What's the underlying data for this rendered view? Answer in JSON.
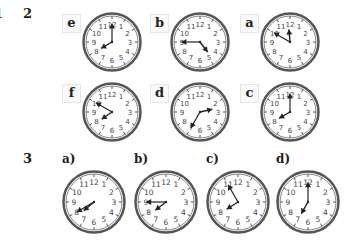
{
  "page": {
    "cut_off_number": "1",
    "section2": {
      "number": "2",
      "clocks": [
        {
          "label": "e",
          "hour": 8,
          "minute": 0
        },
        {
          "label": "b",
          "hour": 4,
          "minute": 45
        },
        {
          "label": "a",
          "hour": 11,
          "minute": 50
        },
        {
          "label": "f",
          "hour": 7,
          "minute": 50
        },
        {
          "label": "d",
          "hour": 2,
          "minute": 35
        },
        {
          "label": "c",
          "hour": 8,
          "minute": 0
        }
      ]
    },
    "section3": {
      "number": "3",
      "clocks": [
        {
          "label": "a)",
          "hour": 7,
          "minute": 40
        },
        {
          "label": "b)",
          "hour": 7,
          "minute": 45
        },
        {
          "label": "c)",
          "hour": 7,
          "minute": 55
        },
        {
          "label": "d)",
          "hour": 7,
          "minute": 0
        }
      ]
    },
    "clock_numerals": [
      "12",
      "1",
      "2",
      "3",
      "4",
      "5",
      "6",
      "7",
      "8",
      "9",
      "10",
      "11"
    ],
    "colors": {
      "frame": "#555555",
      "hands": "#222222",
      "numerals": "#444444",
      "label_border": "#e6e6e6"
    }
  }
}
